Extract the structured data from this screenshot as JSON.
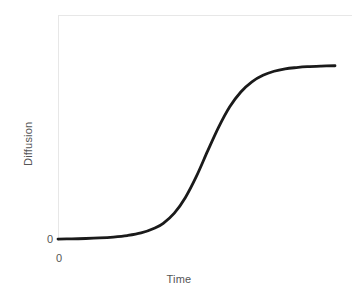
{
  "chart_data": {
    "type": "line",
    "title": "",
    "subtitle": "",
    "xlabel": "Time",
    "ylabel": "Diffusion",
    "xticklabels": [
      "0"
    ],
    "yticklabels": [
      "0"
    ],
    "xlim": [
      0,
      1
    ],
    "ylim": [
      0,
      1
    ],
    "grid": false,
    "legend": null,
    "legend_position": "none",
    "annotations": [],
    "series": [
      {
        "name": "Diffusion",
        "color": "#1a1a1a",
        "linewidth": 2.8,
        "description": "S-shaped logistic diffusion curve: flat near zero, steep rise through the midpoint, then saturating plateau",
        "x": [
          0.0,
          0.05,
          0.1,
          0.15,
          0.2,
          0.25,
          0.3,
          0.35,
          0.38,
          0.42,
          0.46,
          0.5,
          0.54,
          0.58,
          0.62,
          0.66,
          0.7,
          0.74,
          0.78,
          0.82,
          0.86,
          0.9,
          0.95,
          1.0
        ],
        "y": [
          0.005,
          0.006,
          0.008,
          0.011,
          0.016,
          0.024,
          0.038,
          0.065,
          0.09,
          0.145,
          0.23,
          0.345,
          0.48,
          0.61,
          0.72,
          0.8,
          0.855,
          0.89,
          0.912,
          0.925,
          0.932,
          0.937,
          0.94,
          0.942
        ]
      }
    ]
  },
  "axes": {
    "ylabel_text": "Diffusion",
    "xlabel_text": "Time",
    "y_origin_tick": "0",
    "x_origin_tick": "0"
  },
  "style": {
    "background": "#ffffff",
    "spine_color": "#e7e7e7",
    "text_color": "#555555",
    "curve_color": "#1a1a1a"
  }
}
